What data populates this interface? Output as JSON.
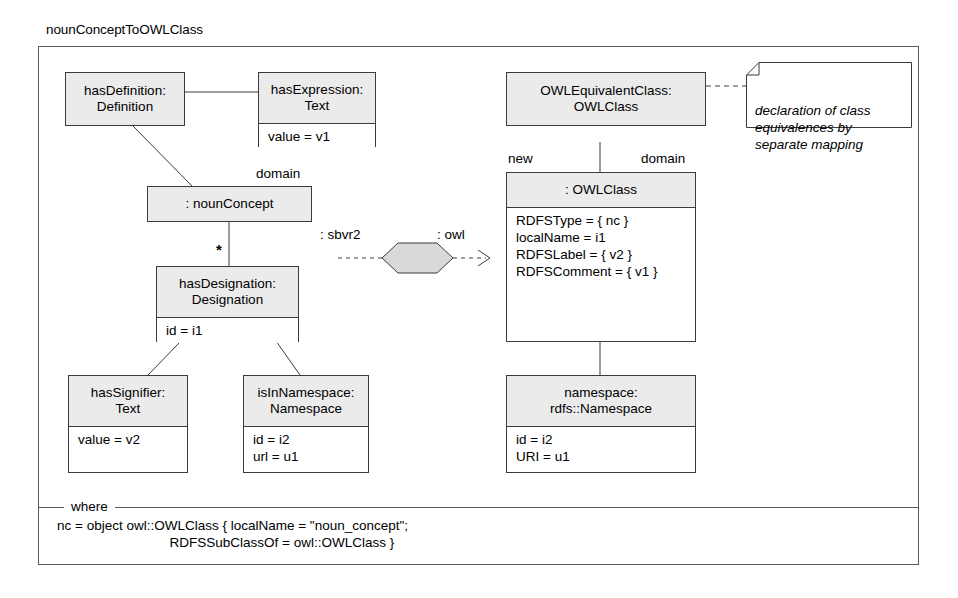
{
  "diagram": {
    "frame_title": "nounConceptToOWLClass",
    "where_label": "where",
    "where_body": "nc = object owl::OWLClass { localName = \"noun_concept\";\n                              RDFSSubClassOf = owl::OWLClass }"
  },
  "boxes": {
    "has_definition": {
      "header": "hasDefinition:\nDefinition",
      "body": ""
    },
    "has_expression": {
      "header": "hasExpression:\nText",
      "body": "value = v1"
    },
    "noun_concept": {
      "header": ": nounConcept",
      "body": ""
    },
    "has_designation": {
      "header": "hasDesignation:\nDesignation",
      "body": "id = i1"
    },
    "has_signifier": {
      "header": "hasSignifier:\nText",
      "body": "value = v2"
    },
    "is_in_namespace": {
      "header": "isInNamespace:\nNamespace",
      "body": "id = i2\nurl = u1"
    },
    "owl_equivalent_class": {
      "header": "OWLEquivalentClass:\nOWLClass",
      "body": ""
    },
    "owl_class": {
      "header": ": OWLClass",
      "body": "RDFSType = { nc }\nlocalName = i1\nRDFSLabel = { v2 }\nRDFSComment = { v1 }"
    },
    "namespace": {
      "header": "namespace:\nrdfs::Namespace",
      "body": "id = i2\nURI = u1"
    }
  },
  "note": {
    "text": "declaration of class\nequivalences by\nseparate mapping"
  },
  "labels": {
    "domain_left": "domain",
    "multiplicity_star": "*",
    "transform_left": ": sbvr2",
    "transform_right": ": owl",
    "new": "new",
    "domain_right": "domain"
  },
  "colors": {
    "header_fill": "#ebebeb",
    "body_fill": "#ffffff",
    "box_stroke": "#3b3b3b",
    "frame_stroke": "#5a5a5a",
    "hexagon_fill": "#d9d9d9",
    "page_background": "#ffffff"
  }
}
